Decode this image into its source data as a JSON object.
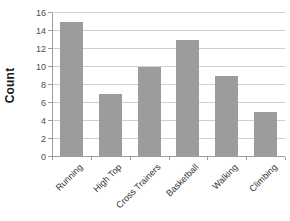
{
  "figure": {
    "background": "#ffffff"
  },
  "chart_data": {
    "type": "bar",
    "title": "",
    "xlabel": "",
    "ylabel": "Count",
    "categories": [
      "Running",
      "High Top",
      "Cross Trainers",
      "Basketball",
      "Walking",
      "Climbing"
    ],
    "values": [
      15,
      7,
      10,
      13,
      9,
      5
    ],
    "ylim": [
      0,
      16
    ],
    "yticks": [
      0,
      2,
      4,
      6,
      8,
      10,
      12,
      14,
      16
    ],
    "grid": "horizontal",
    "legend": "none",
    "colors": {
      "bar": "#9c9c9c",
      "gridline": "#cfcfcf",
      "axis": "#9f9f9f",
      "tick_label": "#4d4d4d",
      "category_label": "#333333",
      "ylabel": "#1a1a1a"
    }
  }
}
